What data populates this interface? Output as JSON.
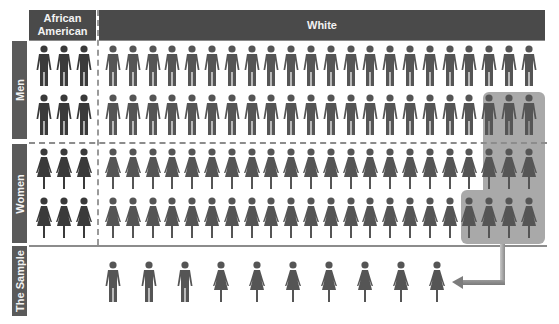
{
  "headers": {
    "african_american": "African American",
    "white": "White"
  },
  "row_labels": {
    "men": "Men",
    "women": "Women",
    "sample": "The Sample"
  },
  "icons": {
    "man": "man-icon",
    "woman": "woman-icon",
    "arrow": "arrow-left-icon"
  },
  "colors": {
    "header_bg": "#4a4a4a",
    "side_label_bg": "#5a5a5a",
    "figure_african_american": "#3a3a3a",
    "figure_white": "#555555",
    "highlight_bg": "#a9a9a9"
  },
  "population": {
    "african_american_per_row": 3,
    "white_per_row": 22,
    "rows": [
      {
        "group": "men",
        "row": 1
      },
      {
        "group": "men",
        "row": 2
      },
      {
        "group": "women",
        "row": 1
      },
      {
        "group": "women",
        "row": 2
      }
    ]
  },
  "highlight": {
    "description": "Selected subset feeding the sample",
    "men_row2_last": 3,
    "women_row1_last": 3,
    "women_row2_last": 4
  },
  "sample": {
    "figures": [
      "man",
      "man",
      "man",
      "woman",
      "woman",
      "woman",
      "woman",
      "woman",
      "woman",
      "woman"
    ],
    "men_count": 3,
    "women_count": 7
  }
}
